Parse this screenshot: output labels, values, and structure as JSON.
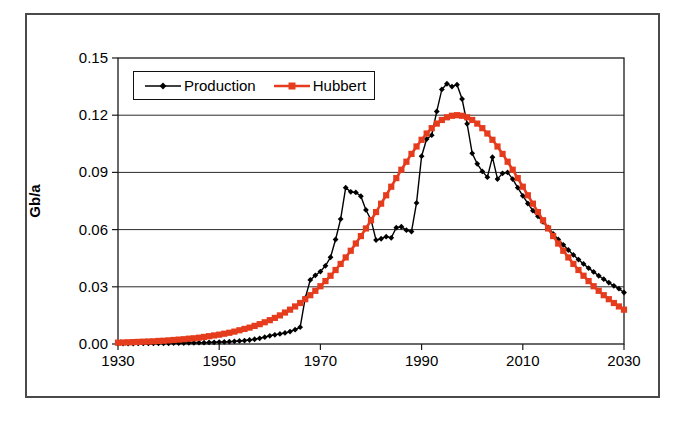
{
  "figure": {
    "background": "#ffffff",
    "outer_border_color": "#4a4a4a"
  },
  "chart_data": {
    "type": "line",
    "title": "",
    "xlabel": "",
    "ylabel": "Gb/a",
    "xlim": [
      1930,
      2030
    ],
    "ylim": [
      0,
      0.15
    ],
    "grid": "horizontal",
    "grid_color": "#2a2a2a",
    "axis_color": "#1a1a1a",
    "legend_position": "top-left-inside",
    "x_ticks": [
      1930,
      1950,
      1970,
      1990,
      2010,
      2030
    ],
    "x_tick_labels": [
      "1930",
      "1950",
      "1970",
      "1990",
      "2010",
      "2030"
    ],
    "y_ticks": [
      0,
      0.03,
      0.06,
      0.09,
      0.12,
      0.15
    ],
    "y_tick_labels": [
      "0.00",
      "0.03",
      "0.06",
      "0.09",
      "0.12",
      "0.15"
    ],
    "years": [
      1930,
      1931,
      1932,
      1933,
      1934,
      1935,
      1936,
      1937,
      1938,
      1939,
      1940,
      1941,
      1942,
      1943,
      1944,
      1945,
      1946,
      1947,
      1948,
      1949,
      1950,
      1951,
      1952,
      1953,
      1954,
      1955,
      1956,
      1957,
      1958,
      1959,
      1960,
      1961,
      1962,
      1963,
      1964,
      1965,
      1966,
      1967,
      1968,
      1969,
      1970,
      1971,
      1972,
      1973,
      1974,
      1975,
      1976,
      1977,
      1978,
      1979,
      1980,
      1981,
      1982,
      1983,
      1984,
      1985,
      1986,
      1987,
      1988,
      1989,
      1990,
      1991,
      1992,
      1993,
      1994,
      1995,
      1996,
      1997,
      1998,
      1999,
      2000,
      2001,
      2002,
      2003,
      2004,
      2005,
      2006,
      2007,
      2008,
      2009,
      2010,
      2011,
      2012,
      2013,
      2014,
      2015,
      2016,
      2017,
      2018,
      2019,
      2020,
      2021,
      2022,
      2023,
      2024,
      2025,
      2026,
      2027,
      2028,
      2029,
      2030
    ],
    "series": [
      {
        "name": "Production",
        "color": "#000000",
        "marker": "diamond",
        "values": [
          0.0002,
          0.0002,
          0.0002,
          0.0002,
          0.0003,
          0.0003,
          0.0003,
          0.0003,
          0.0004,
          0.0004,
          0.0004,
          0.0005,
          0.0005,
          0.0005,
          0.0006,
          0.0006,
          0.0007,
          0.0007,
          0.0008,
          0.0009,
          0.001,
          0.0011,
          0.0012,
          0.0014,
          0.0016,
          0.0018,
          0.0021,
          0.0025,
          0.003,
          0.0036,
          0.0043,
          0.0048,
          0.0053,
          0.0058,
          0.0065,
          0.0075,
          0.0088,
          0.024,
          0.0336,
          0.036,
          0.038,
          0.041,
          0.0455,
          0.0548,
          0.0655,
          0.082,
          0.0798,
          0.0795,
          0.0775,
          0.0703,
          0.0652,
          0.0545,
          0.0552,
          0.0563,
          0.0557,
          0.061,
          0.0615,
          0.0597,
          0.059,
          0.074,
          0.0985,
          0.1075,
          0.1095,
          0.122,
          0.1335,
          0.1365,
          0.135,
          0.136,
          0.1285,
          0.1155,
          0.1,
          0.0945,
          0.0905,
          0.0875,
          0.098,
          0.0865,
          0.0895,
          0.09,
          0.0865,
          0.082,
          0.0777,
          0.0737,
          0.0699,
          0.067,
          0.064,
          0.0612,
          0.0578,
          0.0548,
          0.052,
          0.0493,
          0.0467,
          0.0443,
          0.042,
          0.0398,
          0.0378,
          0.0358,
          0.034,
          0.0322,
          0.0305,
          0.029,
          0.027
        ]
      },
      {
        "name": "Hubbert",
        "color": "#e63c1e",
        "marker": "square",
        "values": [
          0.0007,
          0.0008,
          0.0009,
          0.001,
          0.0011,
          0.0012,
          0.0013,
          0.0014,
          0.0016,
          0.0017,
          0.0019,
          0.0021,
          0.0023,
          0.0025,
          0.0028,
          0.003,
          0.0033,
          0.0037,
          0.0041,
          0.0045,
          0.0049,
          0.0054,
          0.0059,
          0.0065,
          0.0072,
          0.0079,
          0.0086,
          0.0095,
          0.0104,
          0.0114,
          0.0125,
          0.0137,
          0.015,
          0.0165,
          0.018,
          0.0197,
          0.0215,
          0.0235,
          0.0256,
          0.0279,
          0.0303,
          0.033,
          0.0358,
          0.0388,
          0.042,
          0.0454,
          0.0489,
          0.0527,
          0.0566,
          0.0606,
          0.0649,
          0.0692,
          0.0736,
          0.078,
          0.0825,
          0.087,
          0.0914,
          0.0956,
          0.0997,
          0.1036,
          0.1071,
          0.1104,
          0.1132,
          0.1156,
          0.1175,
          0.1189,
          0.1197,
          0.12,
          0.1197,
          0.1189,
          0.1175,
          0.1156,
          0.1132,
          0.1104,
          0.1071,
          0.1036,
          0.0997,
          0.0956,
          0.0914,
          0.087,
          0.0825,
          0.078,
          0.0736,
          0.0692,
          0.0649,
          0.0606,
          0.0566,
          0.0527,
          0.0489,
          0.0454,
          0.042,
          0.0388,
          0.0358,
          0.033,
          0.0303,
          0.0279,
          0.0256,
          0.0235,
          0.0215,
          0.0197,
          0.018
        ]
      }
    ]
  }
}
